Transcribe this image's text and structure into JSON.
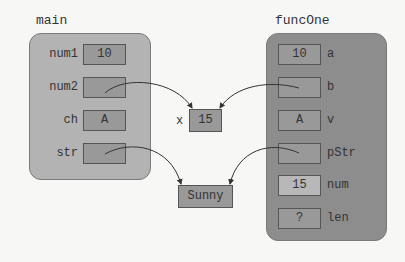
{
  "frames": {
    "main": {
      "title": "main",
      "vars": [
        {
          "name": "num1",
          "value": "10"
        },
        {
          "name": "num2",
          "value": ""
        },
        {
          "name": "ch",
          "value": "A"
        },
        {
          "name": "str",
          "value": ""
        }
      ]
    },
    "funcOne": {
      "title": "funcOne",
      "vars": [
        {
          "name": "a",
          "value": "10"
        },
        {
          "name": "b",
          "value": ""
        },
        {
          "name": "v",
          "value": "A"
        },
        {
          "name": "pStr",
          "value": ""
        },
        {
          "name": "num",
          "value": "15"
        },
        {
          "name": "len",
          "value": "?"
        }
      ]
    }
  },
  "heap": {
    "x": {
      "label": "x",
      "value": "15"
    },
    "sunny": {
      "value": "Sunny"
    }
  },
  "colors": {
    "background": "#f7f7f5",
    "main_frame": "#b3b3b3",
    "func_frame": "#8d8d8d",
    "cell": "#999999",
    "cell_highlight": "#b8b8b8"
  }
}
